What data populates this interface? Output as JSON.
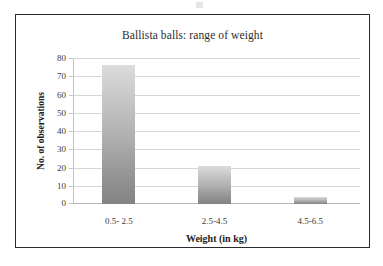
{
  "figure": {
    "frame_border_color": "#2b2b2b",
    "background": "#ffffff"
  },
  "chart_data": {
    "type": "bar",
    "title": "Ballista balls: range of weight",
    "xlabel": "Weight (in kg)",
    "ylabel": "No. of observations",
    "categories": [
      "0.5- 2.5",
      "2.5-4.5",
      "4.5-6.5"
    ],
    "values": [
      76,
      21,
      4
    ],
    "ylim": [
      0,
      80
    ],
    "yticks": [
      0,
      10,
      20,
      30,
      40,
      50,
      60,
      70,
      80
    ],
    "ytick_labels": [
      "0",
      "10",
      "20",
      "30",
      "40",
      "50",
      "60",
      "70",
      "80"
    ],
    "grid": true,
    "legend": null,
    "bar_fill_top": "#dcdcdc",
    "bar_fill_bottom": "#838383",
    "gridline_color": "#d6d6d6"
  }
}
